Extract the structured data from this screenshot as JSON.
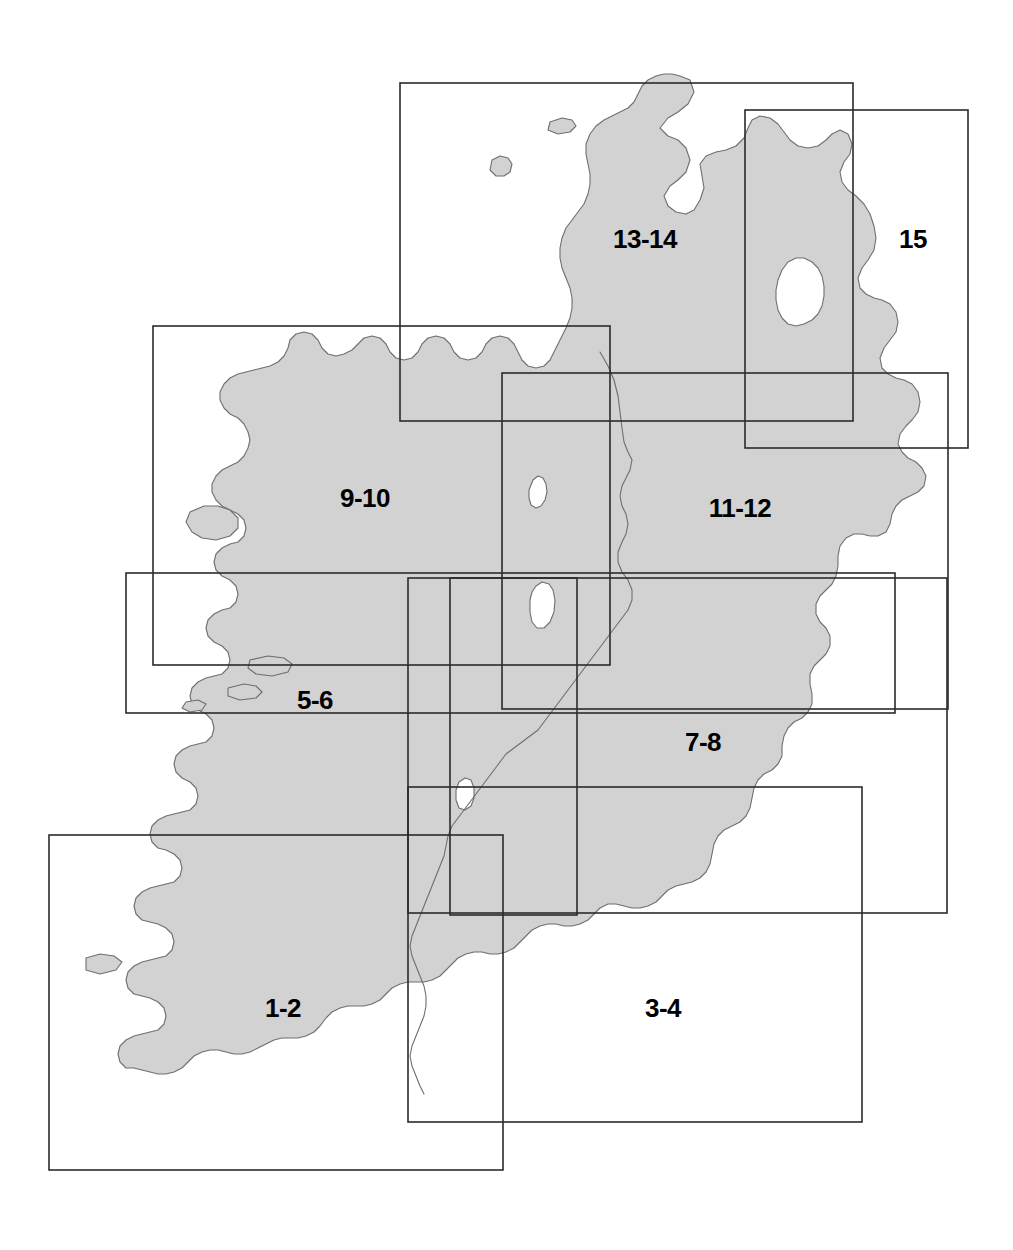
{
  "map": {
    "title": "Ireland map sheet index",
    "width": 1013,
    "height": 1250,
    "land_fill": "#d2d2d2",
    "coast_stroke": "#6e6e6e",
    "rect_stroke": "#2b2b2b",
    "background": "#ffffff"
  },
  "sheets": [
    {
      "id": "sheet-1-2",
      "label": "1-2",
      "label_x": 283,
      "label_y": 1008,
      "rect": {
        "x": 49,
        "y": 835,
        "w": 454,
        "h": 335
      }
    },
    {
      "id": "sheet-3-4",
      "label": "3-4",
      "label_x": 663,
      "label_y": 1008,
      "rect": {
        "x": 408,
        "y": 787,
        "w": 454,
        "h": 335
      }
    },
    {
      "id": "sheet-5-6",
      "label": "5-6",
      "label_x": 315,
      "label_y": 700,
      "rect": {
        "x": 126,
        "y": 573,
        "w": 769,
        "h": 140
      }
    },
    {
      "id": "sheet-7-8",
      "label": "7-8",
      "label_x": 703,
      "label_y": 742,
      "rect": {
        "x": 408,
        "y": 578,
        "w": 539,
        "h": 335
      }
    },
    {
      "id": "sheet-9-10",
      "label": "9-10",
      "label_x": 365,
      "label_y": 498,
      "rect": {
        "x": 153,
        "y": 326,
        "w": 457,
        "h": 339
      }
    },
    {
      "id": "sheet-11-12",
      "label": "11-12",
      "label_x": 740,
      "label_y": 508,
      "rect": {
        "x": 502,
        "y": 373,
        "w": 446,
        "h": 336
      }
    },
    {
      "id": "sheet-13-14",
      "label": "13-14",
      "label_x": 645,
      "label_y": 239,
      "rect": {
        "x": 400,
        "y": 83,
        "w": 453,
        "h": 338
      }
    },
    {
      "id": "sheet-15",
      "label": "15",
      "label_x": 913,
      "label_y": 239,
      "rect": {
        "x": 745,
        "y": 110,
        "w": 223,
        "h": 338
      }
    }
  ],
  "center_box": {
    "id": "sheet-center-box",
    "label": "",
    "rect": {
      "x": 450,
      "y": 578,
      "w": 127,
      "h": 337
    }
  }
}
